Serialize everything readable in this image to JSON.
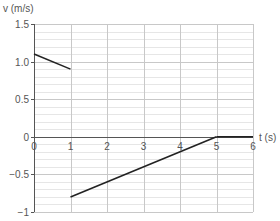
{
  "chart_data": {
    "type": "line",
    "title": "",
    "xlabel": "t (s)",
    "ylabel": "v (m/s)",
    "xlim": [
      0,
      6
    ],
    "ylim": [
      -1,
      1.5
    ],
    "x_ticks": [
      0,
      1,
      2,
      3,
      4,
      5,
      6
    ],
    "x_tick_labels": [
      "0",
      "1",
      "2",
      "3",
      "4",
      "5",
      "6"
    ],
    "y_ticks": [
      1.5,
      1.0,
      0.5,
      0,
      -0.5,
      -1
    ],
    "y_tick_labels": [
      "1.5",
      "1.0",
      "0.5",
      "0",
      "−0.5",
      "−1"
    ],
    "grid": true,
    "minor_grid_y_step": 0.1,
    "series": [
      {
        "name": "velocity",
        "segments": [
          {
            "x": [
              0,
              1
            ],
            "y": [
              1.1,
              0.9
            ]
          },
          {
            "x": [
              1,
              5
            ],
            "y": [
              -0.8,
              0
            ]
          },
          {
            "x": [
              5,
              6
            ],
            "y": [
              0,
              0
            ]
          }
        ],
        "color": "#222222"
      }
    ]
  },
  "colors": {
    "major_grid": "#c8c8c8",
    "minor_grid": "#e6e6e6",
    "axis": "#555555",
    "line": "#222222"
  }
}
